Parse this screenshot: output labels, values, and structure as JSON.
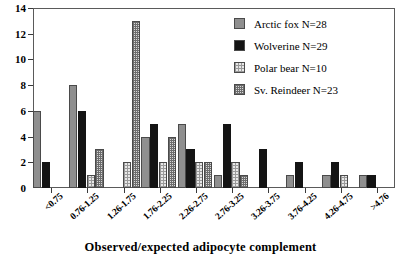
{
  "chart_data": {
    "type": "bar",
    "title": "",
    "xlabel": "Observed/expected adipocyte complement",
    "ylabel": "",
    "ylim": [
      0,
      14
    ],
    "ytick_values": [
      0,
      2,
      4,
      6,
      8,
      10,
      12,
      14
    ],
    "ytick_labels": [
      "0",
      "2",
      "4",
      "6",
      "8",
      "10",
      "12",
      "14"
    ],
    "grid": false,
    "legend_position": "top-right",
    "categories": [
      "<0.75",
      "0.76-1.25",
      "1.26-1.75",
      "1.76-2.25",
      "2.26-2.75",
      "2.76-3.25",
      "3.26-3.75",
      "3.76-4.25",
      "4.26-4.75",
      ">4.76"
    ],
    "series": [
      {
        "name": "Arctic fox N=28",
        "short_name": "Arctic fox",
        "n": 28,
        "fill": "solid-gray",
        "color": "#8f8f8f",
        "values": [
          6,
          8,
          0,
          4,
          5,
          1,
          0,
          1,
          1,
          1
        ]
      },
      {
        "name": "Wolverine N=29",
        "short_name": "Wolverine",
        "n": 29,
        "fill": "solid-black",
        "color": "#141414",
        "values": [
          2,
          6,
          0,
          5,
          3,
          5,
          3,
          2,
          2,
          1
        ]
      },
      {
        "name": "Polar bear N=10",
        "short_name": "Polar bear",
        "n": 10,
        "fill": "light-stipple",
        "color": "#e8e8e8",
        "values": [
          0,
          1,
          2,
          2,
          2,
          2,
          0,
          0,
          1,
          0
        ]
      },
      {
        "name": "Sv. Reindeer N=23",
        "short_name": "Sv. Reindeer",
        "n": 23,
        "fill": "dark-checker",
        "color": "#d8d8d8",
        "values": [
          0,
          3,
          13,
          4,
          2,
          1,
          0,
          0,
          0,
          0
        ]
      }
    ]
  }
}
